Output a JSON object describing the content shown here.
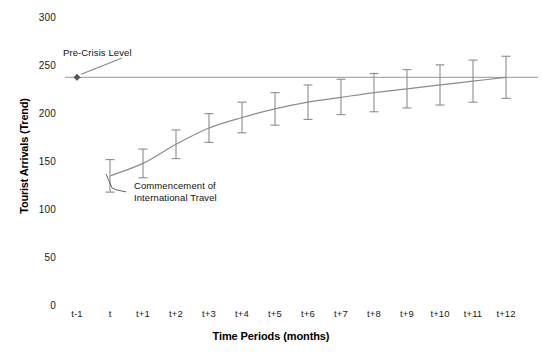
{
  "chart_data": {
    "type": "line",
    "title": "",
    "xlabel": "Time Periods (months)",
    "ylabel": "Tourist Arrivals (Trend)",
    "categories": [
      "t-1",
      "t",
      "t+1",
      "t+2",
      "t+3",
      "t+4",
      "t+5",
      "t+6",
      "t+7",
      "t+8",
      "t+9",
      "t+10",
      "t+11",
      "t+12"
    ],
    "ylim": [
      0,
      300
    ],
    "yticks": [
      0,
      50,
      100,
      150,
      200,
      250,
      300
    ],
    "grid": false,
    "legend": null,
    "series": [
      {
        "name": "Tourist Arrivals (Trend)",
        "values": [
          null,
          135,
          148,
          168,
          185,
          196,
          205,
          212,
          217,
          222,
          226,
          230,
          234,
          238
        ],
        "error_low": [
          null,
          118,
          133,
          153,
          170,
          180,
          188,
          194,
          199,
          202,
          206,
          209,
          212,
          216
        ],
        "error_high": [
          null,
          152,
          163,
          183,
          200,
          212,
          222,
          230,
          236,
          242,
          246,
          251,
          256,
          260
        ]
      }
    ],
    "reference_line": {
      "label": "Pre-Crisis Level",
      "value": 238,
      "style": "solid-thin",
      "marker_at": "t-1"
    },
    "annotations": [
      {
        "name": "pre-crisis-level",
        "text": "Pre-Crisis Level",
        "points_to": "t-1"
      },
      {
        "name": "commencement",
        "text_line1": "Commencement  of",
        "text_line2": "International Travel",
        "points_to": "t"
      }
    ],
    "colors": {
      "line": "#8c8c8c",
      "error_bar": "#8c8c8c",
      "reference_line": "#8c8c8c",
      "text": "#1a1a1a",
      "background": "#ffffff"
    }
  },
  "yticks_text": [
    "300",
    "250",
    "200",
    "150",
    "100",
    "50",
    "0"
  ],
  "xticks_text": [
    "t-1",
    "t",
    "t+1",
    "t+2",
    "t+3",
    "t+4",
    "t+5",
    "t+6",
    "t+7",
    "t+8",
    "t+9",
    "t+10",
    "t+11",
    "t+12"
  ],
  "labels": {
    "x_axis_title": "Time Periods (months)",
    "y_axis_title": "Tourist Arrivals (Trend)"
  },
  "annotation_text": {
    "pre_crisis": "Pre-Crisis Level",
    "commencement_line1": "Commencement  of",
    "commencement_line2": "International Travel"
  }
}
